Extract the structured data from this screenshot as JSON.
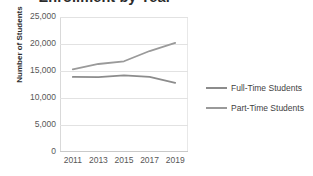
{
  "chart_data": {
    "type": "line",
    "title": "Enrollment by Year",
    "xlabel": "",
    "ylabel": "Number of Students",
    "categories": [
      "2011",
      "2013",
      "2015",
      "2017",
      "2019"
    ],
    "x": [
      2011,
      2013,
      2015,
      2017,
      2019
    ],
    "series": [
      {
        "name": "Full-Time Students",
        "color": "#8c8c8c",
        "values": [
          13900,
          13850,
          14200,
          13900,
          12800
        ]
      },
      {
        "name": "Part-Time Students",
        "color": "#9a9a9a",
        "values": [
          15300,
          16300,
          16800,
          18700,
          20200
        ]
      }
    ],
    "ylim": [
      0,
      25000
    ],
    "ytick_values": [
      0,
      5000,
      10000,
      15000,
      20000,
      25000
    ],
    "ytick_labels": [
      "0",
      "5,000",
      "10,000",
      "15,000",
      "20,000",
      "25,000"
    ],
    "grid": true,
    "legend_position": "right"
  },
  "legend": {
    "entries": [
      {
        "label": "Full-Time Students"
      },
      {
        "label": "Part-Time Students"
      }
    ]
  }
}
